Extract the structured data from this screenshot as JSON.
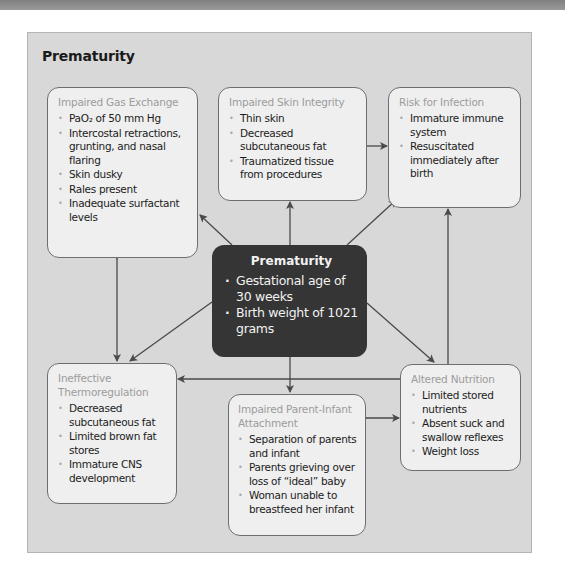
{
  "title": "Prematurity",
  "center": {
    "heading": "Prematurity",
    "items": [
      "Gestational age of 30 weeks",
      "Birth weight of 1021 grams"
    ]
  },
  "boxes": {
    "gas_exchange": {
      "heading": "Impaired Gas Exchange",
      "items": [
        "PaO₂ of 50 mm Hg",
        "Intercostal retractions, grunting, and nasal flaring",
        "Skin dusky",
        "Rales present",
        "Inadequate surfactant levels"
      ]
    },
    "skin_integrity": {
      "heading": "Impaired Skin Integrity",
      "items": [
        "Thin skin",
        "Decreased subcutaneous fat",
        "Traumatized tissue from procedures"
      ]
    },
    "infection": {
      "heading": "Risk for Infection",
      "items": [
        "Immature immune system",
        "Resuscitated immediately after birth"
      ]
    },
    "thermoregulation": {
      "heading": "Ineffective Thermoregulation",
      "items": [
        "Decreased subcutaneous fat",
        "Limited brown fat stores",
        "Immature CNS development"
      ]
    },
    "parent_infant": {
      "heading": "Impaired Parent-Infant Attachment",
      "items": [
        "Separation of parents and infant",
        "Parents grieving over loss of “ideal” baby",
        "Woman unable to breastfeed her infant"
      ]
    },
    "nutrition": {
      "heading": "Altered Nutrition",
      "items": [
        "Limited stored nutrients",
        "Absent suck and swallow reflexes",
        "Weight loss"
      ]
    }
  },
  "colors": {
    "panel_bg": "#d8d8d8",
    "box_bg": "#efefef",
    "center_bg": "#353535",
    "arrow": "#4a4a4a",
    "heading_gray": "#9c9c9c"
  }
}
